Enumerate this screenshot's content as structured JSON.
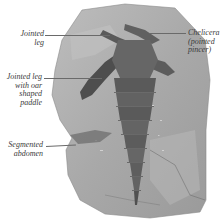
{
  "figure": {
    "colors": {
      "background": "#ffffff",
      "rock": "#a8a8a8",
      "rock_light": "#c4c4c4",
      "fossil_dark": "#555555",
      "fossil_mid": "#707070",
      "label_text": "#3a3a3a",
      "leader_line": "#6a6a6a"
    }
  },
  "labels": [
    {
      "id": "jointed-leg",
      "line1": "Jointed",
      "line2": "leg",
      "line3": "",
      "line4": "",
      "side": "left"
    },
    {
      "id": "jointed-leg-paddle",
      "line1": "Jointed leg",
      "line2": "with oar",
      "line3": "shaped",
      "line4": "paddle",
      "side": "left"
    },
    {
      "id": "segmented-abdomen",
      "line1": "Segmented",
      "line2": "abdomen",
      "line3": "",
      "line4": "",
      "side": "left"
    },
    {
      "id": "chelicera",
      "line1": "Chelicera",
      "line2": "(pointed",
      "line3": "pincer)",
      "line4": "",
      "side": "right"
    }
  ]
}
